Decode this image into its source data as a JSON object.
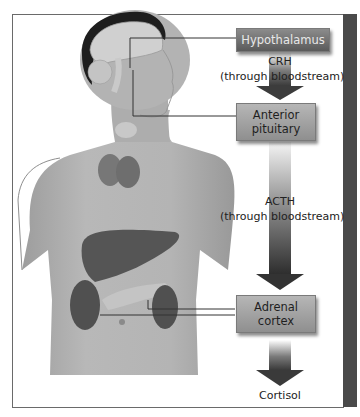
{
  "diagram": {
    "nodes": [
      {
        "id": "hypothalamus",
        "label": "Hypothalamus"
      },
      {
        "id": "anterior-pituitary",
        "label": "Anterior pituitary",
        "line1": "Anterior",
        "line2": "pituitary"
      },
      {
        "id": "adrenal-cortex",
        "label": "Adrenal cortex",
        "line1": "Adrenal",
        "line2": "cortex"
      }
    ],
    "edges": [
      {
        "from": "hypothalamus",
        "to": "anterior-pituitary",
        "hormone": "CRH",
        "route": "(through bloodstream)"
      },
      {
        "from": "anterior-pituitary",
        "to": "adrenal-cortex",
        "hormone": "ACTH",
        "route": "(through bloodstream)"
      },
      {
        "from": "adrenal-cortex",
        "to": "output",
        "hormone": "Cortisol"
      }
    ],
    "illustration": "human-torso-with-brain-thyroid-liver-kidneys",
    "colors": {
      "box_dark": "#5a5a5a",
      "box_light": "#9a9a9a",
      "arrow": "#3c3c3c",
      "frame": "#6a6a6a",
      "side_bar": "#4a4a4a"
    }
  }
}
